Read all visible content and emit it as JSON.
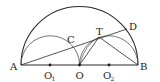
{
  "diagram": {
    "type": "geometry",
    "colors": {
      "stroke": "#2a2a2a",
      "dot": "#1a1a1a",
      "background": "#ffffff"
    },
    "points": {
      "A": {
        "label": "A",
        "x": 21,
        "y": 65
      },
      "B": {
        "label": "B",
        "x": 138,
        "y": 65
      },
      "O": {
        "label": "O",
        "x": 79.5,
        "y": 65
      },
      "O1": {
        "label": "O",
        "sub": "1",
        "x": 50,
        "y": 65
      },
      "O2": {
        "label": "O",
        "sub": "2",
        "x": 109,
        "y": 65
      },
      "C": {
        "label": "C",
        "x": 72,
        "y": 45
      },
      "T": {
        "label": "T",
        "x": 99,
        "y": 37
      },
      "D": {
        "label": "D",
        "x": 127,
        "y": 29
      }
    },
    "elements": [
      "large semicircle on AB centered O",
      "small semicircle on AO centered O1",
      "small semicircle on OB centered O2",
      "segment AB",
      "segment AD",
      "segment OT",
      "segment TB",
      "arc OT"
    ]
  }
}
